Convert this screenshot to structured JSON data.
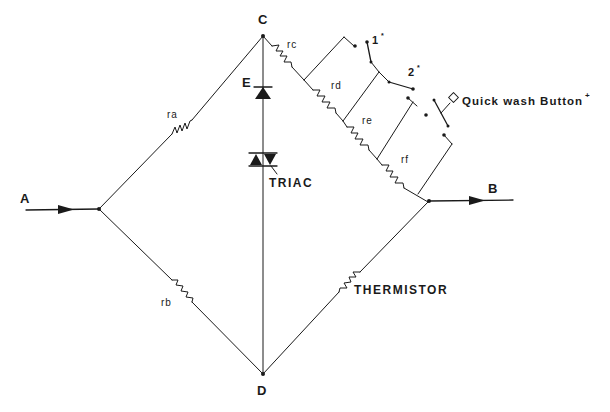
{
  "diagram": {
    "type": "bridge-circuit",
    "nodes": {
      "A": "A",
      "B": "B",
      "C": "C",
      "D": "D",
      "E": "E"
    },
    "resistors": {
      "ra": "ra",
      "rb": "rb",
      "rc": "rc",
      "rd": "rd",
      "re": "re",
      "rf": "rf"
    },
    "components": {
      "triac": "TRIAC",
      "thermistor": "THERMISTOR"
    },
    "switches": {
      "switch_1": "1",
      "switch_1_mark": "*",
      "switch_2": "2",
      "switch_2_mark": "*",
      "quickwash_button": "Quick wash  Button",
      "quickwash_mark": "+"
    },
    "connections": [
      {
        "from": "A",
        "to": "junction-left",
        "label": "input"
      },
      {
        "from": "junction-left",
        "to": "C",
        "via": "ra"
      },
      {
        "from": "junction-left",
        "to": "D",
        "via": "rb"
      },
      {
        "from": "C",
        "to": "D",
        "via": "diode E + TRIAC"
      },
      {
        "from": "C",
        "to": "junction-right",
        "via": "rc, rd, re, rf (series)"
      },
      {
        "from": "junction-right",
        "to": "D",
        "via": "THERMISTOR"
      },
      {
        "from": "junction-right",
        "to": "B",
        "label": "output"
      }
    ],
    "colors": {
      "line": "#1a1a1a",
      "background": "#ffffff"
    }
  }
}
